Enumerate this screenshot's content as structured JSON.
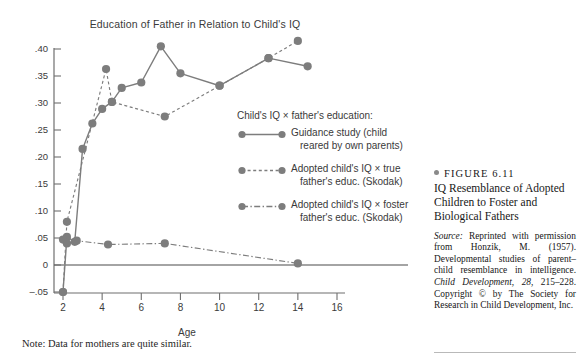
{
  "chart_data": {
    "type": "line",
    "title": "Education of Father in Relation to Child's IQ",
    "xlabel": "Age",
    "ylabel": "",
    "xlim": [
      1.4,
      16.8
    ],
    "ylim": [
      -0.05,
      0.42
    ],
    "grid": false,
    "legend_position": "inside-right",
    "legend_title": "Child's IQ × father's education:",
    "xticks": [
      "2",
      "4",
      "6",
      "8",
      "10",
      "12",
      "14",
      "16"
    ],
    "xtick_values": [
      2,
      4,
      6,
      8,
      10,
      12,
      14,
      16
    ],
    "yticks": [
      ".40",
      ".35",
      ".30",
      ".25",
      ".20",
      ".15",
      ".10",
      ".05",
      "0",
      "–.05"
    ],
    "ytick_values": [
      0.4,
      0.35,
      0.3,
      0.25,
      0.2,
      0.15,
      0.1,
      0.05,
      0.0,
      -0.05
    ],
    "zero_line": 0,
    "series": [
      {
        "name": "Guidance study (child reared by own parents)",
        "style": "solid",
        "color": "#7d7d7d",
        "points": [
          [
            2.0,
            -0.05
          ],
          [
            2.2,
            0.052
          ],
          [
            2.6,
            0.043
          ],
          [
            3.0,
            0.215
          ],
          [
            3.5,
            0.262
          ],
          [
            4.0,
            0.289
          ],
          [
            4.5,
            0.302
          ],
          [
            5.0,
            0.328
          ],
          [
            6.0,
            0.338
          ],
          [
            7.0,
            0.405
          ],
          [
            8.0,
            0.355
          ],
          [
            10.0,
            0.332
          ],
          [
            12.5,
            0.383
          ],
          [
            14.5,
            0.368
          ]
        ]
      },
      {
        "name": "Adopted child's IQ × true father's educ. (Skodak)",
        "style": "dashed",
        "color": "#7d7d7d",
        "points": [
          [
            2.0,
            -0.05
          ],
          [
            2.2,
            0.08
          ],
          [
            4.2,
            0.363
          ],
          [
            4.5,
            0.302
          ],
          [
            7.2,
            0.275
          ],
          [
            10.0,
            0.332
          ],
          [
            12.5,
            0.383
          ],
          [
            14.0,
            0.415
          ]
        ]
      },
      {
        "name": "Adopted child's IQ × foster father's educ. (Skodak)",
        "style": "dashdot",
        "color": "#7d7d7d",
        "points": [
          [
            2.0,
            0.047
          ],
          [
            2.2,
            0.04
          ],
          [
            2.7,
            0.045
          ],
          [
            4.3,
            0.038
          ],
          [
            7.2,
            0.04
          ],
          [
            14.0,
            0.003
          ]
        ]
      }
    ]
  },
  "chart": {
    "title": "Education of Father in Relation to Child's IQ",
    "axis_name": "Age",
    "note": "Note:  Data for mothers are quite similar.",
    "ylabels": [
      ".40",
      ".35",
      ".30",
      ".25",
      ".20",
      ".15",
      ".10",
      ".05",
      "0",
      "–.05"
    ],
    "xlabels": [
      "2",
      "4",
      "6",
      "8",
      "10",
      "12",
      "14",
      "16"
    ]
  },
  "legend": {
    "title": "Child's IQ × father's education:",
    "items": [
      {
        "line1": "Guidance study (child",
        "line2": "reared by own parents)",
        "style": "solid"
      },
      {
        "line1": "Adopted child's IQ × true",
        "line2": "father's educ. (Skodak)",
        "style": "dashed"
      },
      {
        "line1": "Adopted child's IQ × foster",
        "line2": "father's educ. (Skodak)",
        "style": "dashdot"
      }
    ]
  },
  "caption": {
    "figure_label": "FIGURE 6.11",
    "title": "IQ Resemblance of Adopted Children to Foster and Biological Fathers",
    "source_label": "Source:",
    "source_body_1": " Reprinted with permission from Honzik, M. (1957). Developmental studies of parent–child resemblance in intelligence. ",
    "source_journal": "Child Development, 28,",
    "source_body_2": " 215–228. Copyright © by The Society for Research in Child Development, Inc."
  },
  "colors": {
    "marker": "#7d7d7d",
    "axis": "#6f6f6f",
    "text": "#3a3a3a"
  }
}
